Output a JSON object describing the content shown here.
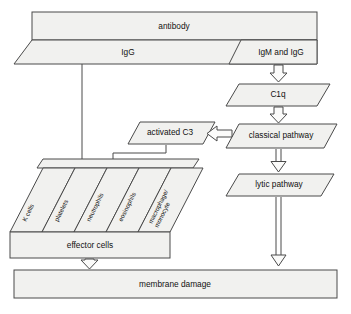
{
  "diagram": {
    "nodes": {
      "antibody": "antibody",
      "igg": "IgG",
      "igm_igg": "IgM and IgG",
      "c1q": "C1q",
      "classical_pathway": "classical pathway",
      "activated_c3": "activated C3",
      "lytic_pathway": "lytic pathway",
      "effector_cells": "effector cells",
      "membrane_damage": "membrane damage"
    },
    "effector_cell_types": [
      "K cells",
      "platelets",
      "neutrophils",
      "eosinophils",
      "macrophage/",
      "monocyte"
    ],
    "colors": {
      "shape_fill": "#f1f1ef",
      "stroke": "#4a4a4a",
      "text": "#111111",
      "background": "#ffffff"
    }
  }
}
